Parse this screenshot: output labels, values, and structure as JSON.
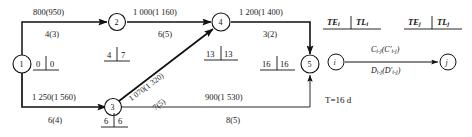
{
  "diagram": {
    "nodes": [
      {
        "id": "1",
        "label": "1",
        "te": "0",
        "tl": "0"
      },
      {
        "id": "2",
        "label": "2",
        "te": "4",
        "tl": "7"
      },
      {
        "id": "3",
        "label": "3",
        "te": "6",
        "tl": "6"
      },
      {
        "id": "4",
        "label": "4",
        "te": "13",
        "tl": "13"
      },
      {
        "id": "5",
        "label": "5",
        "te": "16",
        "tl": "16"
      }
    ],
    "edges": [
      {
        "from": "1",
        "to": "2",
        "cost": "800(950)",
        "duration": "4(3)"
      },
      {
        "from": "2",
        "to": "4",
        "cost": "1 000(1 160)",
        "duration": "6(5)"
      },
      {
        "from": "4",
        "to": "5",
        "cost": "1 200(1 400)",
        "duration": "3(2)"
      },
      {
        "from": "1",
        "to": "3",
        "cost": "1 250(1 560)",
        "duration": "6(4)"
      },
      {
        "from": "3",
        "to": "4",
        "cost": "1 070(1 320)",
        "duration": "7(5)"
      },
      {
        "from": "3",
        "to": "5",
        "cost": "900(1 530)",
        "duration": "8(5)"
      }
    ]
  },
  "legend": {
    "node_i_label": "i",
    "node_j_label": "j",
    "te_i": "TE",
    "te_i_sub": "i",
    "tl_i": "TL",
    "tl_i_sub": "i",
    "te_j": "TE",
    "te_j_sub": "j",
    "tl_j": "TL",
    "tl_j_sub": "j",
    "edge_cost_formula": "C",
    "edge_cost_sub": "i-j",
    "edge_cost_paren": "(C′",
    "edge_cost_paren_sub": "i-j",
    "edge_cost_close": ")",
    "edge_dur_formula": "D",
    "edge_dur_sub": "i-j",
    "edge_dur_paren": "(D′",
    "edge_dur_paren_sub": "i-j",
    "edge_dur_close": ")",
    "total_duration": "T=16 d"
  },
  "colors": {
    "line": "#111111",
    "text": "#111111",
    "background": "#ffffff"
  }
}
